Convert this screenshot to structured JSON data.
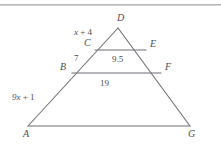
{
  "figure": {
    "type": "geometry-diagram",
    "shape": "triangle-with-parallel-segments",
    "stroke_color": "#6f6f76",
    "text_color": "#4c4c52",
    "background_color": "#ffffff",
    "top_rule_color": "#a8a8ac",
    "vertices": [
      {
        "name": "A",
        "label": "A",
        "x": 28,
        "y": 126
      },
      {
        "name": "B",
        "label": "B",
        "x": 72,
        "y": 73
      },
      {
        "name": "C",
        "label": "C",
        "x": 95,
        "y": 50
      },
      {
        "name": "D",
        "label": "D",
        "x": 118,
        "y": 28
      },
      {
        "name": "E",
        "label": "E",
        "x": 146,
        "y": 50
      },
      {
        "name": "F",
        "label": "F",
        "x": 161,
        "y": 73
      },
      {
        "name": "G",
        "label": "G",
        "x": 190,
        "y": 126
      }
    ],
    "vertex_labels": [
      {
        "name": "vertex-label-D",
        "text": "D",
        "left": 117,
        "top": 13
      },
      {
        "name": "vertex-label-C",
        "text": "C",
        "left": 84,
        "top": 38
      },
      {
        "name": "vertex-label-E",
        "text": "E",
        "left": 150,
        "top": 39
      },
      {
        "name": "vertex-label-B",
        "text": "B",
        "left": 60,
        "top": 62
      },
      {
        "name": "vertex-label-F",
        "text": "F",
        "left": 165,
        "top": 62
      },
      {
        "name": "vertex-label-A",
        "text": "A",
        "left": 23,
        "top": 129
      },
      {
        "name": "vertex-label-G",
        "text": "G",
        "left": 188,
        "top": 129
      }
    ],
    "segments": [
      {
        "name": "side-AD",
        "from": "A",
        "to": "D"
      },
      {
        "name": "side-DG",
        "from": "D",
        "to": "G"
      },
      {
        "name": "base-AG",
        "from": "A",
        "to": "G"
      },
      {
        "name": "segment-CE",
        "from": "C",
        "to": "E"
      },
      {
        "name": "segment-BF",
        "from": "B",
        "to": "F"
      }
    ],
    "measures": [
      {
        "name": "measure-CD",
        "text": "x + 4",
        "var": "x",
        "rest": " + 4",
        "left": 74,
        "top": 28,
        "on": "side-CD"
      },
      {
        "name": "measure-BC",
        "text": "7",
        "left": 74,
        "top": 54,
        "on": "side-BC"
      },
      {
        "name": "measure-AB",
        "text": "9x + 1",
        "var": "9x",
        "rest": " + 1",
        "left": 12,
        "top": 93,
        "on": "side-AB"
      },
      {
        "name": "measure-CE",
        "text": "9.5",
        "left": 112,
        "top": 55,
        "on": "segment-CE"
      },
      {
        "name": "measure-BF",
        "text": "19",
        "left": 100,
        "top": 79,
        "on": "segment-BF"
      }
    ]
  }
}
